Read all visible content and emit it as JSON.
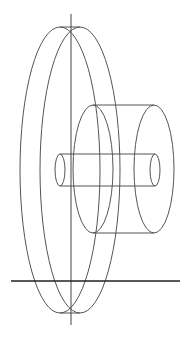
{
  "diagram": {
    "type": "wireframe-3d",
    "colors": {
      "background": "#ffffff",
      "line": "#555555",
      "axis": "#444444",
      "ground": "#222222"
    },
    "axis": {
      "x": 71,
      "y1": 14,
      "y2": 325
    },
    "ground": {
      "y": 281,
      "x1": 11,
      "x2": 180
    },
    "disc": {
      "front": {
        "cx": 60,
        "cy": 170,
        "rx": 40,
        "ry": 143
      },
      "back": {
        "cx": 80,
        "cy": 170,
        "rx": 40,
        "ry": 143
      }
    },
    "hub": {
      "front": {
        "cx": 93,
        "cy": 169,
        "rx": 20,
        "ry": 64
      },
      "back": {
        "cx": 154,
        "cy": 169,
        "rx": 20,
        "ry": 64
      }
    },
    "shaft": {
      "front": {
        "cx": 60,
        "cy": 170,
        "rx": 5,
        "ry": 16
      },
      "back": {
        "cx": 155,
        "cy": 170,
        "rx": 5,
        "ry": 16
      }
    }
  }
}
